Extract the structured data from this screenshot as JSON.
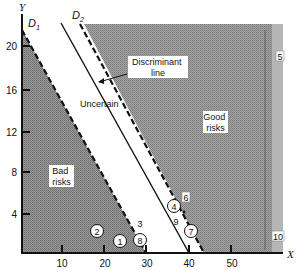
{
  "figure": {
    "axes": {
      "x_label": "X",
      "y_label": "Y",
      "x_ticks": [
        "10",
        "20",
        "30",
        "40",
        "50"
      ],
      "y_ticks": [
        "4",
        "8",
        "12",
        "16",
        "20"
      ]
    },
    "lines": {
      "d1_label": "D",
      "d1_sub": "1",
      "d2_label": "D",
      "d2_sub": "2"
    },
    "regions": {
      "bad_line1": "Bad",
      "bad_line2": "risks",
      "good_line1": "Good",
      "good_line2": "risks",
      "uncertain": "Uncertain",
      "discriminant_line1": "Discriminant",
      "discriminant_line2": "line"
    },
    "points": [
      {
        "id": "1",
        "style": "circle"
      },
      {
        "id": "2",
        "style": "circle"
      },
      {
        "id": "3",
        "style": "plain"
      },
      {
        "id": "4",
        "style": "circle"
      },
      {
        "id": "5",
        "style": "box"
      },
      {
        "id": "6",
        "style": "box"
      },
      {
        "id": "7",
        "style": "circle"
      },
      {
        "id": "8",
        "style": "circle"
      },
      {
        "id": "9",
        "style": "plain"
      },
      {
        "id": "10",
        "style": "box"
      }
    ]
  },
  "colors": {
    "bad_region": "#8a8a8a",
    "good_region": "#9a9a9a",
    "right_strip": "#b8b8b8",
    "ink": "#111111"
  }
}
